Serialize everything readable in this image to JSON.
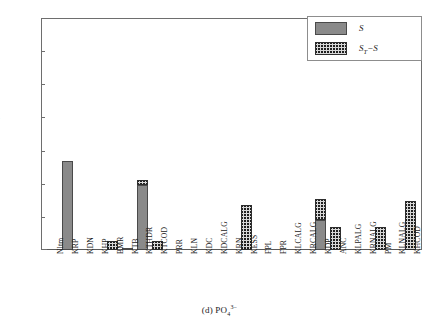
{
  "caption": {
    "prefix": "(d)  PO",
    "subscript": "4",
    "superscript": "3−"
  },
  "legend": {
    "items": [
      {
        "name": "S",
        "label": "S",
        "style": "solid-gray"
      },
      {
        "name": "ST-minus-S",
        "label": "S",
        "sub": "T",
        "suffix": "−S",
        "style": "checkered-hatch"
      }
    ]
  },
  "axes": {
    "y_ticks": [
      "0",
      "0.1",
      "0.2",
      "0.3",
      "0.4",
      "0.5",
      "0.6",
      "0.7"
    ],
    "y_min": 0,
    "y_max": 0.7
  },
  "chart_data": {
    "type": "bar",
    "title": "",
    "subtitle": "(d) PO4 3-",
    "xlabel": "",
    "ylabel": "",
    "ylim": [
      0,
      0.7
    ],
    "ytick_step": 0.1,
    "grid": false,
    "stacked": true,
    "legend_position": "top-right",
    "categories": [
      "Nltm",
      "KRP",
      "KDN",
      "KHP",
      "BMR",
      "KTB",
      "KTHDR",
      "KTCOD",
      "PRR",
      "KLN",
      "KDC",
      "KDCALG",
      "KRN",
      "KESS",
      "FPL",
      "FPR",
      "KLCALG",
      "KRCALG",
      "KDP",
      "ANC",
      "KLPALG",
      "KRNALG",
      "PM",
      "KLNALG",
      "KHCOD"
    ],
    "series": [
      {
        "name": "S",
        "values": [
          0.0,
          0.27,
          0.0,
          0.0,
          0.0,
          0.004,
          0.195,
          0.0,
          0.0,
          0.0,
          0.0,
          0.0,
          0.0,
          0.0,
          0.0,
          0.0,
          0.0,
          0.0,
          0.09,
          0.0,
          0.0,
          0.0,
          0.0,
          0.0,
          0.0
        ]
      },
      {
        "name": "ST-S",
        "values": [
          0.0,
          0.0,
          0.0,
          0.0,
          0.026,
          0.0,
          0.015,
          0.027,
          0.0,
          0.0,
          0.0,
          0.0,
          0.0,
          0.135,
          0.0,
          0.0,
          0.0,
          0.0,
          0.065,
          0.068,
          0.0,
          0.0,
          0.068,
          0.0,
          0.148
        ]
      }
    ],
    "totals": [
      0.0,
      0.27,
      0.0,
      0.0,
      0.026,
      0.004,
      0.21,
      0.027,
      0.0,
      0.0,
      0.0,
      0.0,
      0.0,
      0.135,
      0.0,
      0.0,
      0.0,
      0.0,
      0.155,
      0.068,
      0.0,
      0.0,
      0.068,
      0.0,
      0.148
    ]
  },
  "colors": {
    "series_s_fill": "#8a8a8a",
    "series_s_edge": "#4a4a4a",
    "series_d_fill": "#d8d8d8",
    "series_d_edge": "#2e2e2e",
    "axis": "#6e6e6e",
    "text": "#1a1a1a",
    "background": "#ffffff"
  }
}
